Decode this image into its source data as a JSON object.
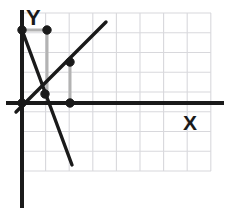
{
  "figure": {
    "kind": "coordinate-plane-graph",
    "background_color": "#ffffff",
    "axis_color": "#1a1a1a",
    "grid_color": "#d8d8dc",
    "guide_color": "#b3b3b3",
    "line_color": "#1a1a1a",
    "point_color": "#1a1a1a",
    "point_outline_color": "#1a1a1a"
  },
  "axes": {
    "x_label": "X",
    "y_label": "Y",
    "x_axis": {
      "y_px": 103,
      "x_start_px": 6,
      "x_end_px": 224
    },
    "y_axis": {
      "x_px": 22,
      "y_start_px": 10,
      "y_end_px": 208
    }
  },
  "grid": {
    "visible": true,
    "left_px": 22,
    "top_px": 13,
    "right_px": 211,
    "bottom_px": 171,
    "cell_width_px": 23.6,
    "cell_height_px": 19.75,
    "columns": 8,
    "rows": 8
  },
  "chart_data": {
    "type": "line",
    "title": "",
    "xlabel": "X",
    "ylabel": "Y",
    "grid": true,
    "legend": "none",
    "xlim": [
      0,
      8
    ],
    "ylim": [
      -4.5,
      4.5
    ],
    "series": [
      {
        "name": "ascending-line",
        "style": "solid",
        "color": "#1a1a1a",
        "x": [
          0.0,
          3.5
        ],
        "y": [
          -1.45,
          4.1
        ],
        "pixel_endpoints": [
          [
            16,
            112
          ],
          [
            106,
            22
          ]
        ]
      },
      {
        "name": "descending-line",
        "style": "solid",
        "color": "#1a1a1a",
        "x": [
          0.0,
          2.1
        ],
        "y": [
          3.7,
          -3.15
        ],
        "pixel_endpoints": [
          [
            22,
            30
          ],
          [
            72,
            165
          ]
        ]
      }
    ],
    "points": [
      {
        "name": "point-y-intercept",
        "x": 0.0,
        "y": 3.7,
        "pixel": [
          22,
          30
        ]
      },
      {
        "name": "point-upper-right",
        "x": 1.05,
        "y": 3.7,
        "pixel": [
          47,
          30
        ]
      },
      {
        "name": "point-intersection",
        "x": 0.95,
        "y": 0.45,
        "pixel": [
          45,
          94
        ]
      },
      {
        "name": "point-on-ascending",
        "x": 2.05,
        "y": 2.1,
        "pixel": [
          70,
          62
        ]
      },
      {
        "name": "point-origin",
        "x": 0.0,
        "y": 0.0,
        "pixel": [
          22,
          103
        ]
      },
      {
        "name": "point-x-axis",
        "x": 2.05,
        "y": 0.0,
        "pixel": [
          70,
          103
        ]
      }
    ],
    "guides": [
      {
        "name": "guide-top-horizontal",
        "from_pixel": [
          22,
          30
        ],
        "to_pixel": [
          47,
          30
        ]
      },
      {
        "name": "guide-left-vertical",
        "from_pixel": [
          47,
          30
        ],
        "to_pixel": [
          47,
          103
        ]
      },
      {
        "name": "guide-bottom-horizontal",
        "from_pixel": [
          22,
          103
        ],
        "to_pixel": [
          70,
          103
        ]
      },
      {
        "name": "guide-right-vertical",
        "from_pixel": [
          70,
          62
        ],
        "to_pixel": [
          70,
          103
        ]
      }
    ]
  }
}
